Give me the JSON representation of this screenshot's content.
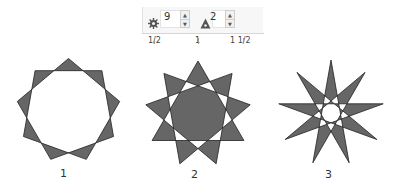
{
  "toolbar": {
    "points": {
      "icon": "gear-icon",
      "value": "9"
    },
    "sharpness": {
      "icon": "triangle-icon",
      "value": "2"
    },
    "spinner_up": "▲",
    "spinner_down": "▼"
  },
  "ruler": {
    "labels": [
      {
        "text": "1/2",
        "x": 8
      },
      {
        "text": "1",
        "x": 55
      },
      {
        "text": "1 1/2",
        "x": 90
      }
    ]
  },
  "figure": {
    "fill": "#666666",
    "stroke": "#222222",
    "stars": [
      {
        "label": "1",
        "n": 9,
        "k": 2,
        "cx": 68.5,
        "cy": 110.5,
        "r": 52,
        "label_x": 60,
        "label_y": 167
      },
      {
        "label": "2",
        "n": 9,
        "k": 3,
        "cx": 198,
        "cy": 114,
        "r": 53,
        "label_x": 191,
        "label_y": 168
      },
      {
        "label": "3",
        "n": 9,
        "k": 4,
        "cx": 331,
        "cy": 113,
        "r": 53,
        "label_x": 325,
        "label_y": 168
      }
    ]
  }
}
